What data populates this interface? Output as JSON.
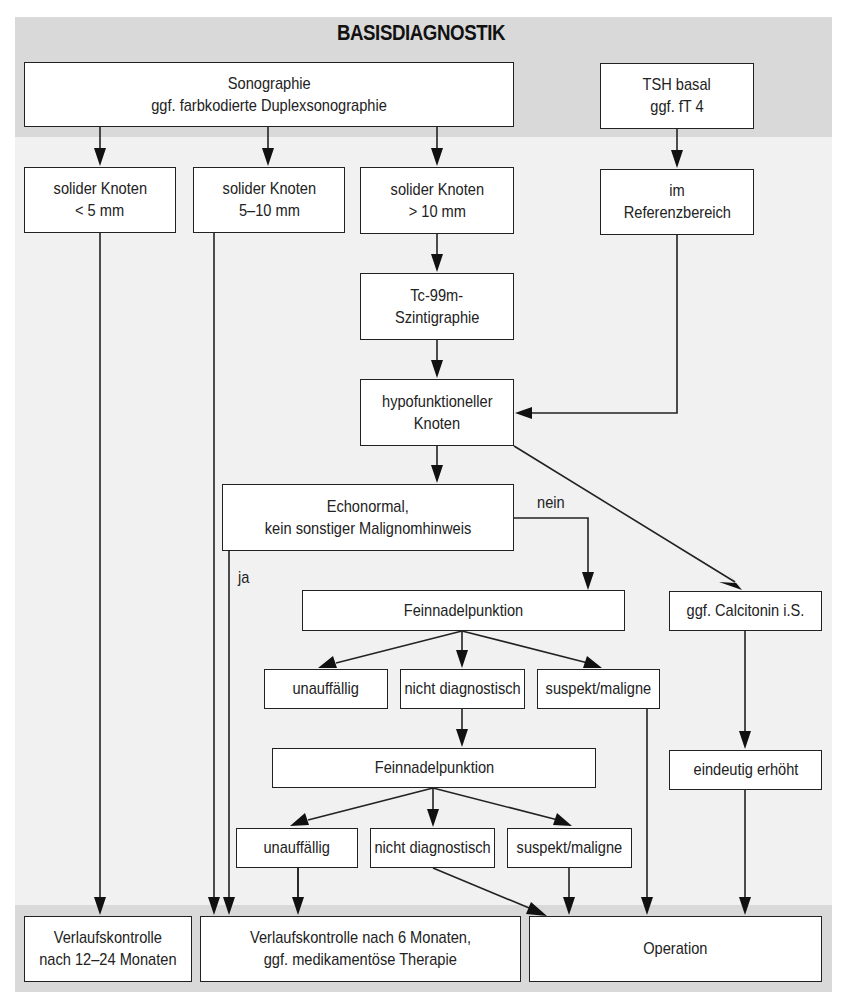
{
  "title": "BASISDIAGNOSTIK",
  "nodes": {
    "sonographie": {
      "line1": "Sonographie",
      "line2": "ggf. farbkodierte Duplexsonographie"
    },
    "tsh": {
      "line1": "TSH basal",
      "line2": "ggf. fT 4"
    },
    "knoten_lt5": {
      "line1": "solider Knoten",
      "line2": "< 5 mm"
    },
    "knoten_5_10": {
      "line1": "solider Knoten",
      "line2": "5–10 mm"
    },
    "knoten_gt10": {
      "line1": "solider Knoten",
      "line2": "> 10 mm"
    },
    "referenz": {
      "line1": "im",
      "line2": "Referenzbereich"
    },
    "szinti": {
      "line1": "Tc-99m-",
      "line2": "Szintigraphie"
    },
    "hypo": {
      "line1": "hypofunktioneller",
      "line2": "Knoten"
    },
    "echo": {
      "line1": "Echonormal,",
      "line2": "kein sonstiger Malignomhinweis"
    },
    "fnp1": {
      "line1": "Feinnadelpunktion"
    },
    "calcitonin": {
      "line1": "ggf. Calcitonin i.S."
    },
    "r1_unauff": {
      "line1": "unauffällig"
    },
    "r1_nichtdiag": {
      "line1": "nicht diagnostisch"
    },
    "r1_suspekt": {
      "line1": "suspekt/maligne"
    },
    "fnp2": {
      "line1": "Feinnadelpunktion"
    },
    "erhoeht": {
      "line1": "eindeutig erhöht"
    },
    "r2_unauff": {
      "line1": "unauffällig"
    },
    "r2_nichtdiag": {
      "line1": "nicht diagnostisch"
    },
    "r2_suspekt": {
      "line1": "suspekt/maligne"
    },
    "verlauf_12_24": {
      "line1": "Verlaufskontrolle",
      "line2": "nach 12–24 Monaten"
    },
    "verlauf_6": {
      "line1": "Verlaufskontrolle nach 6 Monaten,",
      "line2": "ggf. medikamentöse Therapie"
    },
    "operation": {
      "line1": "Operation"
    }
  },
  "edge_labels": {
    "nein": "nein",
    "ja": "ja"
  }
}
